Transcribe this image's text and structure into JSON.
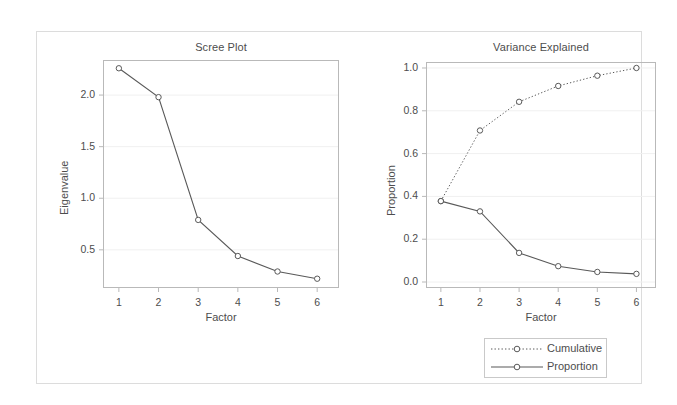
{
  "figure": {
    "background_color": "#ffffff",
    "border_color": "#dcdcdc",
    "line_color": "#595959",
    "marker_fill": "#ffffff",
    "marker_stroke": "#595959",
    "text_color": "#4d4d4d",
    "axis_color": "#b9b9b9",
    "grid_color": "#f0f0f0"
  },
  "legend": {
    "items": [
      {
        "label": "Cumulative",
        "style": "dotted",
        "marker": "circle-open"
      },
      {
        "label": "Proportion",
        "style": "solid",
        "marker": "circle-open"
      }
    ]
  },
  "chart_data": [
    {
      "type": "line",
      "title": "Scree Plot",
      "xlabel": "Factor",
      "ylabel": "Eigenvalue",
      "x": [
        1,
        2,
        3,
        4,
        5,
        6
      ],
      "xticklabels": [
        "1",
        "2",
        "3",
        "4",
        "5",
        "6"
      ],
      "values": [
        2.26,
        1.98,
        0.79,
        0.44,
        0.29,
        0.22
      ],
      "yticks": [
        0.5,
        1.0,
        1.5,
        2.0
      ],
      "yticklabels": [
        "0.5",
        "1.0",
        "1.5",
        "2.0"
      ],
      "xlim": [
        0.6,
        6.55
      ],
      "ylim": [
        0.13,
        2.34
      ],
      "grid": true,
      "legend_position": "none",
      "series": [
        {
          "name": "Eigenvalue",
          "style": "solid",
          "marker": "circle-open",
          "values": [
            2.26,
            1.98,
            0.79,
            0.44,
            0.29,
            0.22
          ]
        }
      ]
    },
    {
      "type": "line",
      "title": "Variance Explained",
      "xlabel": "Factor",
      "ylabel": "Proportion",
      "x": [
        1,
        2,
        3,
        4,
        5,
        6
      ],
      "xticklabels": [
        "1",
        "2",
        "3",
        "4",
        "5",
        "6"
      ],
      "yticks": [
        0.0,
        0.2,
        0.4,
        0.6,
        0.8,
        1.0
      ],
      "yticklabels": [
        "0.0",
        "0.2",
        "0.4",
        "0.6",
        "0.8",
        "1.0"
      ],
      "xlim": [
        0.62,
        6.5
      ],
      "ylim": [
        -0.028,
        1.028
      ],
      "grid": true,
      "legend_position": "below-right",
      "series": [
        {
          "name": "Cumulative",
          "style": "dotted",
          "marker": "circle-open",
          "values": [
            0.378,
            0.708,
            0.842,
            0.916,
            0.964,
            1.0
          ]
        },
        {
          "name": "Proportion",
          "style": "solid",
          "marker": "circle-open",
          "values": [
            0.378,
            0.33,
            0.136,
            0.074,
            0.047,
            0.038
          ]
        }
      ]
    }
  ]
}
